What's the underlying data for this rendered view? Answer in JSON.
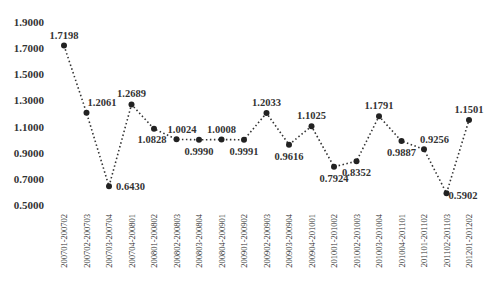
{
  "chart_data": {
    "type": "line",
    "title": "",
    "xlabel": "",
    "ylabel": "",
    "ylim": [
      0.5,
      1.9
    ],
    "yticks": [
      "0.5000",
      "0.7000",
      "0.9000",
      "1.1000",
      "1.3000",
      "1.5000",
      "1.7000",
      "1.9000"
    ],
    "grid": false,
    "legend": null,
    "line_style": "dotted",
    "marker": "filled-circle",
    "categories": [
      "200701-200702",
      "200702-200703",
      "200703-200704",
      "200704-200801",
      "200801-200802",
      "200802-200803",
      "200803-200804",
      "200804-200901",
      "200901-200902",
      "200902-200903",
      "200903-200904",
      "200904-201001",
      "201001-201002",
      "201002-201003",
      "201003-201004",
      "201004-201101",
      "201101-201102",
      "201102-201103",
      "201201-201202"
    ],
    "values": [
      1.7198,
      1.2061,
      0.643,
      1.2689,
      1.0828,
      1.0024,
      0.999,
      1.0008,
      0.9991,
      1.2033,
      0.9616,
      1.1025,
      0.7924,
      0.8352,
      1.1791,
      0.9887,
      0.9256,
      0.5902,
      1.1501
    ],
    "value_labels": [
      "1.7198",
      "1.2061",
      "0.6430",
      "1.2689",
      "1.0828",
      "1.0024",
      "0.9990",
      "1.0008",
      "0.9991",
      "1.2033",
      "0.9616",
      "1.1025",
      "0.7924",
      "0.8352",
      "1.1791",
      "0.9887",
      "0.9256",
      "0.5902",
      "1.1501"
    ],
    "label_positions": [
      "above",
      "right",
      "right",
      "above",
      "below",
      "right",
      "below",
      "above",
      "below",
      "above",
      "below",
      "above",
      "below",
      "below",
      "above",
      "below",
      "right",
      "right",
      "above"
    ]
  },
  "colors": {
    "line": "#333333",
    "marker": "#222222",
    "text": "#333333"
  }
}
